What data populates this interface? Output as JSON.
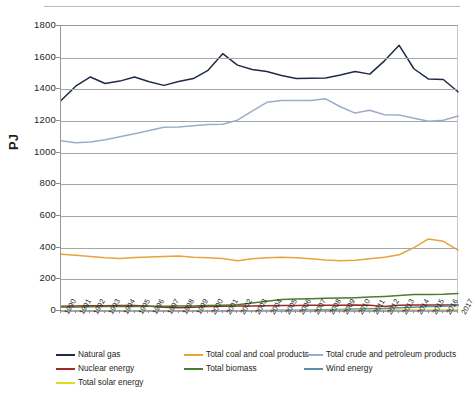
{
  "chart_data": {
    "type": "line",
    "title": "",
    "xlabel": "",
    "ylabel": "PJ",
    "ylim": [
      0,
      1800
    ],
    "ytick_step": 200,
    "yticks": [
      0,
      200,
      400,
      600,
      800,
      1000,
      1200,
      1400,
      1600,
      1800
    ],
    "grid": "horizontal",
    "legend_position": "bottom",
    "categories": [
      "1990",
      "1991",
      "1992",
      "1993",
      "1994",
      "1995",
      "1996",
      "1997",
      "1998",
      "1999",
      "2000",
      "2001",
      "2002",
      "2003",
      "2004",
      "2005",
      "2006",
      "2007",
      "2008",
      "2009",
      "2010",
      "2011",
      "2012",
      "2013",
      "2014",
      "2015",
      "2016",
      "2017"
    ],
    "series": [
      {
        "name": "Natural gas",
        "color": "#1f2b47",
        "values": [
          1330,
          1420,
          1478,
          1437,
          1452,
          1478,
          1448,
          1425,
          1450,
          1468,
          1520,
          1625,
          1553,
          1525,
          1512,
          1488,
          1468,
          1470,
          1472,
          1490,
          1512,
          1496,
          1580,
          1678,
          1530,
          1465,
          1462,
          1385
        ]
      },
      {
        "name": "Total coal and coal products",
        "color": "#e8a33d",
        "values": [
          358,
          352,
          344,
          336,
          332,
          338,
          341,
          345,
          347,
          340,
          336,
          332,
          318,
          330,
          336,
          340,
          336,
          330,
          322,
          318,
          320,
          330,
          340,
          355,
          400,
          455,
          440,
          385
        ]
      },
      {
        "name": "Total crude and petroleum products",
        "color": "#9badc9",
        "values": [
          1075,
          1062,
          1068,
          1082,
          1100,
          1120,
          1140,
          1160,
          1162,
          1170,
          1178,
          1180,
          1205,
          1262,
          1318,
          1330,
          1330,
          1330,
          1340,
          1290,
          1250,
          1268,
          1240,
          1238,
          1218,
          1198,
          1205,
          1232
        ]
      },
      {
        "name": "Nuclear energy",
        "color": "#9e2b25",
        "values": [
          30,
          32,
          33,
          33,
          34,
          34,
          30,
          24,
          20,
          24,
          28,
          30,
          31,
          32,
          33,
          34,
          35,
          36,
          37,
          37,
          38,
          36,
          28,
          36,
          38,
          38,
          38,
          38
        ]
      },
      {
        "name": "Total biomass",
        "color": "#4a7c32",
        "values": [
          25,
          26,
          27,
          28,
          28,
          29,
          30,
          30,
          31,
          32,
          34,
          36,
          40,
          50,
          62,
          72,
          76,
          78,
          80,
          82,
          84,
          88,
          92,
          98,
          104,
          104,
          106,
          110
        ]
      },
      {
        "name": "Wind energy",
        "color": "#5b8fa8",
        "values": [
          0,
          0,
          0,
          0,
          0,
          0,
          0,
          0,
          0,
          0,
          1,
          1,
          2,
          2,
          3,
          4,
          5,
          6,
          8,
          10,
          12,
          14,
          16,
          20,
          24,
          28,
          30,
          34
        ]
      },
      {
        "name": "Total solar energy",
        "color": "#d9e021",
        "values": [
          1,
          1,
          1,
          1,
          1,
          1,
          1,
          1,
          1,
          1,
          1,
          1,
          1,
          2,
          2,
          2,
          2,
          3,
          3,
          4,
          4,
          5,
          5,
          6,
          6,
          7,
          7,
          8
        ]
      }
    ]
  },
  "legend": {
    "items": [
      {
        "label": "Natural gas"
      },
      {
        "label": "Total coal and coal products"
      },
      {
        "label": "Total crude and petroleum products"
      },
      {
        "label": "Nuclear energy"
      },
      {
        "label": "Total biomass"
      },
      {
        "label": "Wind energy"
      },
      {
        "label": "Total solar energy"
      }
    ]
  }
}
